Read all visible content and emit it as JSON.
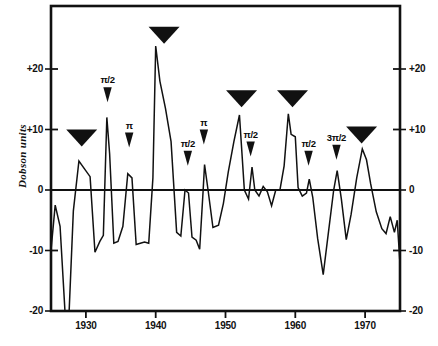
{
  "figure": {
    "ylabel": "Dobson units",
    "background": "#ffffff",
    "ink": "#111111"
  },
  "chart_data": {
    "type": "line",
    "title": "",
    "xlabel": "",
    "ylabel": "Dobson units",
    "xlim": [
      1925,
      1975
    ],
    "ylim": [
      -20,
      28
    ],
    "grid": false,
    "legend": "none",
    "zero_line": true,
    "xticks": [
      1930,
      1940,
      1950,
      1960,
      1970
    ],
    "xtick_labels": [
      "1930",
      "1940",
      "1950",
      "1960",
      "1970"
    ],
    "yticks": [
      -20,
      -10,
      0,
      10,
      20
    ],
    "ytick_labels_left": [
      "-20",
      "-10",
      "0",
      "+10",
      "+20"
    ],
    "ytick_labels_right": [
      "-20",
      "-10",
      "0",
      "+10",
      "+20"
    ],
    "series": [
      {
        "name": "Ozone anomaly",
        "x": [
          1925.0,
          1925.6,
          1926.3,
          1927.0,
          1927.6,
          1928.2,
          1929.0,
          1929.8,
          1930.6,
          1931.3,
          1932.0,
          1932.5,
          1933.0,
          1933.4,
          1934.0,
          1934.6,
          1935.3,
          1936.0,
          1936.6,
          1937.2,
          1937.8,
          1938.4,
          1939.0,
          1939.6,
          1940.0,
          1940.6,
          1941.4,
          1942.2,
          1943.0,
          1943.6,
          1944.2,
          1944.7,
          1945.2,
          1945.8,
          1946.3,
          1946.8,
          1947.0,
          1947.5,
          1948.2,
          1949.0,
          1949.7,
          1950.4,
          1951.2,
          1952.0,
          1952.7,
          1953.3,
          1953.8,
          1954.2,
          1954.8,
          1955.4,
          1956.0,
          1956.6,
          1957.2,
          1957.8,
          1958.4,
          1959.0,
          1959.4,
          1960.0,
          1960.4,
          1961.0,
          1961.6,
          1962.0,
          1962.5,
          1963.2,
          1964.0,
          1964.8,
          1965.5,
          1966.0,
          1966.6,
          1967.3,
          1968.0,
          1968.8,
          1969.6,
          1970.2,
          1970.8,
          1971.6,
          1972.4,
          1973.0,
          1973.6,
          1974.2,
          1974.6,
          1975.0
        ],
        "y": [
          -10.0,
          -2.5,
          -6.0,
          -20.0,
          -20.0,
          -3.5,
          4.8,
          3.5,
          2.2,
          -10.3,
          -8.5,
          -7.5,
          12.0,
          6.0,
          -8.8,
          -8.5,
          -6.0,
          2.7,
          2.0,
          -9.0,
          -8.8,
          -8.6,
          -8.8,
          2.0,
          23.8,
          18.0,
          13.5,
          8.0,
          -7.0,
          -7.6,
          0.0,
          -0.5,
          -7.8,
          -8.3,
          -9.8,
          0.0,
          4.2,
          0.0,
          -6.2,
          -5.8,
          -2.2,
          3.0,
          8.0,
          12.4,
          0.0,
          -1.5,
          3.8,
          0.0,
          -1.0,
          0.6,
          -0.3,
          -2.6,
          0.0,
          0.0,
          4.0,
          12.6,
          9.2,
          8.8,
          0.4,
          -1.0,
          -0.5,
          1.8,
          -1.2,
          -8.0,
          -14.0,
          -6.5,
          0.0,
          3.2,
          -1.5,
          -8.2,
          -4.0,
          2.0,
          6.8,
          5.0,
          1.0,
          -3.6,
          -6.4,
          -7.2,
          -4.4,
          -7.0,
          -5.0,
          -12.2
        ]
      }
    ],
    "markers": {
      "large_triangles": {
        "label": "",
        "x": [
          1929.4,
          1941.2,
          1952.3,
          1959.6,
          1969.5
        ],
        "y": [
          10.0,
          27.0,
          16.5,
          16.5,
          10.5
        ]
      },
      "phase_markers": [
        {
          "label": "π/2",
          "x": 1933.1,
          "y": 17.0
        },
        {
          "label": "π",
          "x": 1936.2,
          "y": 9.5
        },
        {
          "label": "π/2",
          "x": 1944.6,
          "y": 6.5
        },
        {
          "label": "π",
          "x": 1946.9,
          "y": 10.0
        },
        {
          "label": "π/2",
          "x": 1953.6,
          "y": 8.0
        },
        {
          "label": "π/2",
          "x": 1961.9,
          "y": 6.5
        },
        {
          "label": "3π/2",
          "x": 1965.9,
          "y": 7.5
        }
      ]
    }
  }
}
